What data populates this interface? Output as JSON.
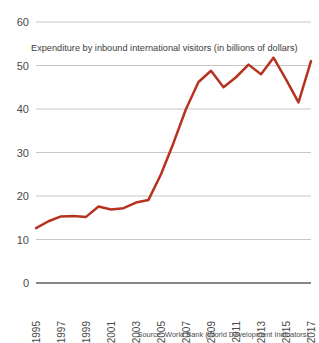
{
  "chart_data": {
    "type": "line",
    "title": "Expenditure by inbound international visitors (in billions of dollars)",
    "xlabel": "",
    "ylabel": "",
    "ylim": [
      0,
      60
    ],
    "yticks": [
      0,
      10,
      20,
      30,
      40,
      50,
      60
    ],
    "grid": true,
    "legend": null,
    "source": "Source: World Bank (World Development Indicators).",
    "line_color": "#b5331f",
    "x": [
      1995,
      1996,
      1997,
      1998,
      1999,
      2000,
      2001,
      2002,
      2003,
      2004,
      2005,
      2006,
      2007,
      2008,
      2009,
      2010,
      2011,
      2012,
      2013,
      2014,
      2015,
      2016,
      2017
    ],
    "xtick_labels": [
      "1995",
      "1997",
      "1999",
      "2001",
      "2003",
      "2005",
      "2007",
      "2009",
      "2011",
      "2013",
      "2015",
      "2017"
    ],
    "xtick_values": [
      1995,
      1997,
      1999,
      2001,
      2003,
      2005,
      2007,
      2009,
      2011,
      2013,
      2015,
      2017
    ],
    "values": [
      12.6,
      14.2,
      15.3,
      15.4,
      15.2,
      17.6,
      16.9,
      17.2,
      18.5,
      19.1,
      25.0,
      32.2,
      40.0,
      46.2,
      48.8,
      45.0,
      47.3,
      50.2,
      48.0,
      51.8,
      46.8,
      41.5,
      51.0
    ],
    "series_name": "Expenditure by inbound international visitors"
  },
  "axis": {
    "y_axis_name": "expenditure-billions-usd",
    "x_axis_name": "year"
  }
}
